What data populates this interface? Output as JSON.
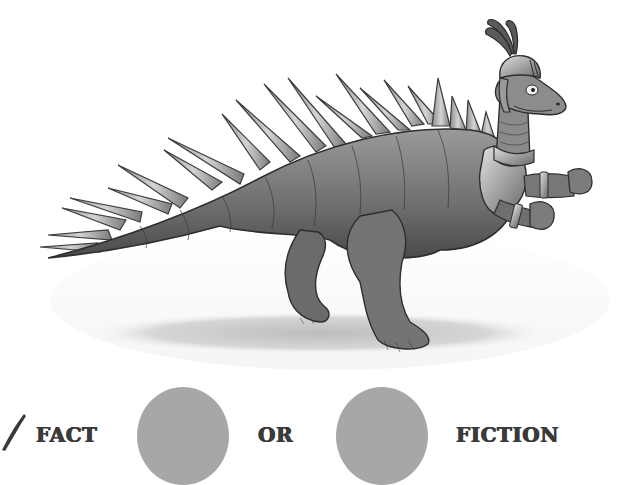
{
  "illustration": {
    "subject": "armored-dinosaur-knight",
    "description": "Spiky-backed dinosaur wearing a knight's helmet with plume and arm armor, walking with fists raised"
  },
  "answer_row": {
    "check_icon": "check-mark-icon",
    "fact_label": "FACT",
    "or_label": "OR",
    "fiction_label": "FICTION",
    "circle_color": "#a7a7a7"
  }
}
